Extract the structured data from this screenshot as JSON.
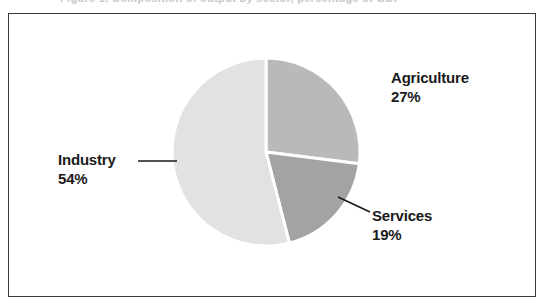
{
  "caption": {
    "text": "Figure 1.  Composition of output by sector, percentage of GDP"
  },
  "colors": {
    "industry": "#e2e2e2",
    "agriculture": "#b9b9b9",
    "services": "#a3a3a3",
    "separator": "#ffffff",
    "frame": "#3a3a3a",
    "leader_line": "#1a1a1a",
    "label_text": "#1a1a1a",
    "background": "#ffffff"
  },
  "chart_data": {
    "type": "pie",
    "title": "",
    "legend_position": "callout-labels",
    "grid": false,
    "total": 100,
    "unit": "%",
    "categories": [
      "Agriculture",
      "Services",
      "Industry"
    ],
    "values": [
      27,
      19,
      54
    ],
    "slices": [
      {
        "name": "Agriculture",
        "value": 27,
        "label_name": "Agriculture",
        "label_value": "27%",
        "color": "#b9b9b9",
        "start_angle_deg": 0,
        "end_angle_deg": 97.2,
        "leader_line": false
      },
      {
        "name": "Services",
        "value": 19,
        "label_name": "Services",
        "label_value": "19%",
        "color": "#a3a3a3",
        "start_angle_deg": 97.2,
        "end_angle_deg": 165.6,
        "leader_line": true
      },
      {
        "name": "Industry",
        "value": 54,
        "label_name": "Industry",
        "label_value": "54%",
        "color": "#e2e2e2",
        "start_angle_deg": 165.6,
        "end_angle_deg": 360,
        "leader_line": true
      }
    ]
  }
}
